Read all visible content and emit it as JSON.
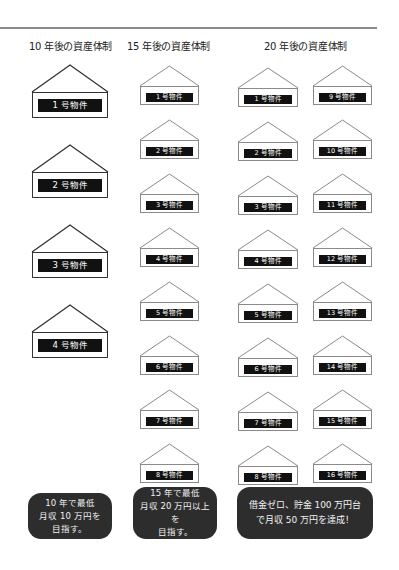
{
  "headings": {
    "col10": "10 年後の資産体制",
    "col15": "15 年後の資産体制",
    "col20": "20 年後の資産体制"
  },
  "properties_10yr": [
    "1 号物件",
    "2 号物件",
    "3 号物件",
    "4 号物件"
  ],
  "properties_15yr": [
    "1 号物件",
    "2 号物件",
    "3 号物件",
    "4 号物件",
    "5 号物件",
    "6 号物件",
    "7 号物件",
    "8 号物件"
  ],
  "properties_20yr_left": [
    "1 号物件",
    "2 号物件",
    "3 号物件",
    "4 号物件",
    "5 号物件",
    "6 号物件",
    "7 号物件",
    "8 号物件"
  ],
  "properties_20yr_right": [
    "9 号物件",
    "10 号物件",
    "11 号物件",
    "12 号物件",
    "13 号物件",
    "14 号物件",
    "15 号物件",
    "16 号物件"
  ],
  "goals": {
    "yr10": [
      "10 年で最低",
      "月収 10 万円を",
      "目指す。"
    ],
    "yr15": [
      "15 年で最低",
      "月収 20 万円以上を",
      "目指す。"
    ],
    "yr20": [
      "借金ゼロ、貯金 100 万円台",
      "で月収 50 万円を達成！"
    ]
  },
  "colors": {
    "rule": "#8a8a8a",
    "label_bg": "#111111",
    "goal_bg": "#2d2d2d",
    "big_house_stroke": "#333333",
    "small_house_stroke": "#8a8a8a"
  }
}
